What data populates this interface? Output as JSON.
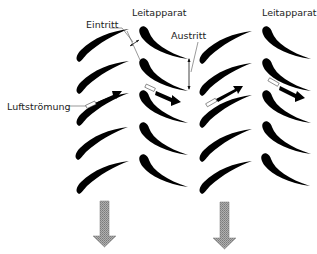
{
  "diagram": {
    "labels": {
      "inlet": "Eintritt",
      "guide_vane_1": "Leitapparat",
      "outlet": "Austritt",
      "guide_vane_2": "Leitapparat",
      "airflow": "Luftströmung"
    },
    "columns": [
      {
        "name": "rotor-row-1",
        "type": "rotor",
        "blade_count": 5
      },
      {
        "name": "stator-row-1",
        "type": "guide-vane",
        "blade_count": 5
      },
      {
        "name": "rotor-row-2",
        "type": "rotor",
        "blade_count": 5
      },
      {
        "name": "stator-row-2",
        "type": "guide-vane",
        "blade_count": 5
      }
    ],
    "flow_arrows": 4,
    "output_arrows": 2,
    "colors": {
      "blade": "#000000",
      "output_arrow": "#9a9a9a",
      "text": "#222222"
    }
  }
}
